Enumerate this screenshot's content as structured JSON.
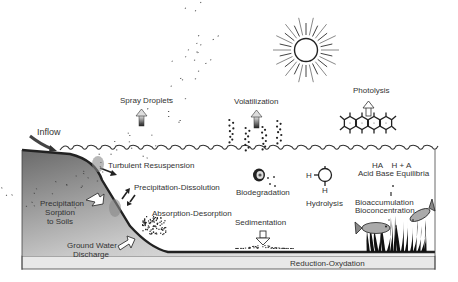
{
  "diagram": {
    "type": "environmental fate processes of a chemical in a water body",
    "labels": {
      "inflow": "Inflow",
      "spray_droplets": "Spray Droplets",
      "volatilization": "Volatilization",
      "photolysis": "Photolysis",
      "turbulent_resuspension": "Turbulent Resuspension",
      "precipitation_dissolution": "Precipitation-Dissolution",
      "precipitation_sorption_1": "Precipitation",
      "precipitation_sorption_2": "Sorption",
      "precipitation_sorption_3": "to Soils",
      "absorption_desorption": "Absorption-Desorption",
      "ground_water_1": "Ground Water",
      "ground_water_2": "Discharge",
      "biodegradation": "Biodegradation",
      "hydrolysis": "Hydrolysis",
      "hydrolysis_h_left": "H",
      "hydrolysis_h_bottom": "H",
      "sedimentation": "Sedimentation",
      "acid_base_formula": "HA    H + A",
      "acid_base": "Acid Base Equilibria",
      "bioaccumulation": "Bioaccumulation",
      "bioconcentration": "Bioconcentration",
      "reduction_oxydation": "Reduction-Oxydation"
    },
    "icons": [
      "sun-icon",
      "up-arrow-icon",
      "down-arrow-icon",
      "benzene-ring-chain-icon",
      "fish-icon",
      "seaweed-icon",
      "microbe-icon",
      "water-wave-icon"
    ],
    "colors": {
      "line": "#333333",
      "ground_dark": "#6e6e6e",
      "ground_light": "#f2f2f2",
      "sediment_band": "#e6e6e6",
      "text": "#333333"
    }
  }
}
